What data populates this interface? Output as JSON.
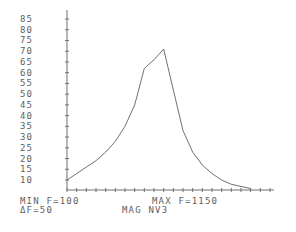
{
  "chart_data": {
    "type": "line",
    "title": "",
    "xlabel": "F",
    "ylabel": "MAG NV3",
    "x_min": 100,
    "x_max": 1150,
    "x_step": 50,
    "ylim": [
      10,
      85
    ],
    "y_ticks": [
      85,
      80,
      75,
      70,
      65,
      60,
      55,
      50,
      45,
      40,
      35,
      30,
      25,
      20,
      15,
      10
    ],
    "grid": false,
    "x": [
      100,
      150,
      200,
      250,
      300,
      350,
      400,
      450,
      500,
      550,
      600,
      650,
      700,
      750,
      800,
      850,
      900,
      950,
      1000,
      1050
    ],
    "series": [
      {
        "name": "MAG NV3",
        "values": [
          10,
          13,
          16,
          19,
          23,
          28,
          35,
          45,
          62,
          66,
          71,
          52,
          33,
          23,
          17,
          13,
          10,
          8,
          7,
          6
        ]
      }
    ]
  },
  "footer": {
    "min_f": "MIN F=100",
    "max_f": "MAX F=1150",
    "delta_f": "ΔF=50",
    "mag_label": "MAG NV3"
  }
}
